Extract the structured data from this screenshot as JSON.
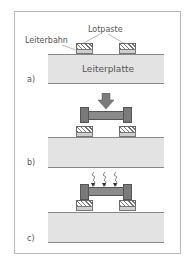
{
  "labels": {
    "solder_paste": "Lotpaste",
    "trace": "Leiterbahn",
    "circuit_board": "Leiterplatte"
  },
  "steps": [
    {
      "id": "a)",
      "description": "Lotpaste auf Leiterbahn aufgetragen"
    },
    {
      "id": "b)",
      "description": "Bauteil wird aufgesetzt"
    },
    {
      "id": "c)",
      "description": "Erwärmen / Löten"
    }
  ],
  "colors": {
    "board": "#e3e3e3",
    "component": "#8a8a8a",
    "frame": "#b8b8b8"
  }
}
